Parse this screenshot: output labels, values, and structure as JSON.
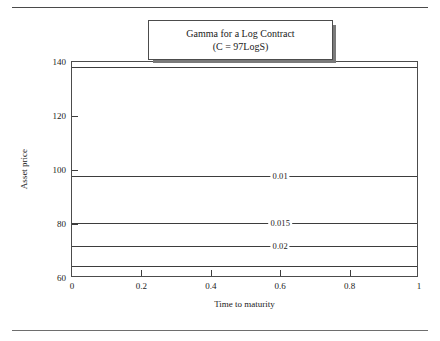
{
  "figure": {
    "title_line1": "Gamma for a Log Contract",
    "title_line2": "(C = 97LogS)"
  },
  "chart_data": {
    "type": "line",
    "title": "Gamma for a Log Contract (C = 97LogS)",
    "xlabel": "Time to maturity",
    "ylabel": "Asset price",
    "xlim": [
      0,
      1
    ],
    "ylim": [
      60,
      140
    ],
    "grid": false,
    "legend": "none",
    "x_ticks": [
      "0",
      "0.2",
      "0.4",
      "0.6",
      "0.8",
      "1"
    ],
    "x_tick_values": [
      0,
      0.2,
      0.4,
      0.6,
      0.8,
      1
    ],
    "y_ticks": [
      "60",
      "80",
      "100",
      "120",
      "140"
    ],
    "y_tick_values": [
      60,
      80,
      100,
      120,
      140
    ],
    "contours": [
      {
        "label": "",
        "level": null,
        "asset_price": 138.0,
        "label_x": null,
        "labeled": false
      },
      {
        "label": "0.01",
        "level": 0.01,
        "asset_price": 97.8,
        "label_x": 0.6,
        "labeled": true
      },
      {
        "label": "0.015",
        "level": 0.015,
        "asset_price": 80.5,
        "label_x": 0.6,
        "labeled": true
      },
      {
        "label": "0.02",
        "level": 0.02,
        "asset_price": 71.8,
        "label_x": 0.6,
        "labeled": true
      },
      {
        "label": "",
        "level": null,
        "asset_price": 64.6,
        "label_x": null,
        "labeled": false
      }
    ]
  }
}
